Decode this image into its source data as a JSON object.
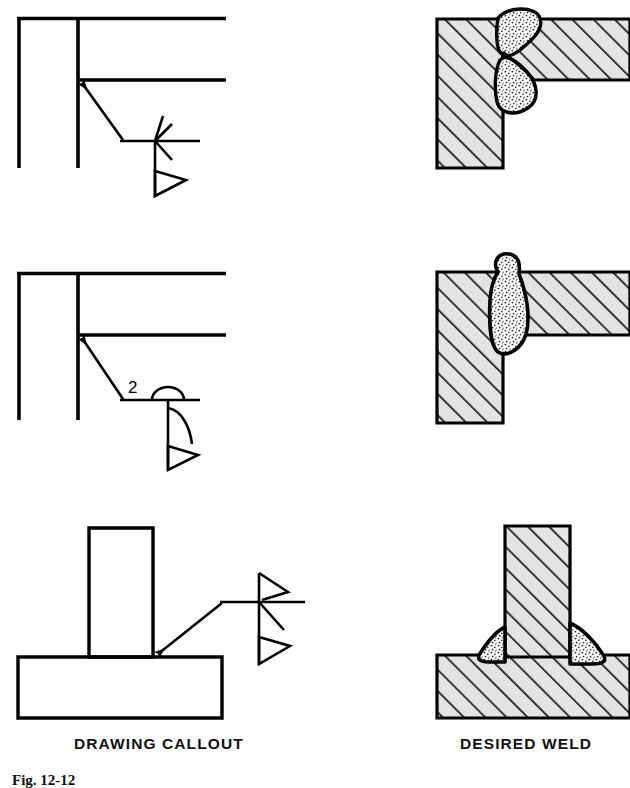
{
  "figure": {
    "captions": {
      "drawing_callout": "DRAWING CALLOUT",
      "desired_weld": "DESIRED WELD"
    },
    "figure_number": "Fig. 12-12",
    "colors": {
      "line": "#000000",
      "metal_fill": "#e3e3e3",
      "hatch": "#1a1a1a",
      "weld_fill": "#ffffff",
      "background": "#ffffff"
    }
  },
  "rows": [
    {
      "id": "row-1",
      "callout": {
        "joint_type": "corner-joint-flare-bevel",
        "weld_symbol": "double-flare-bevel-groove",
        "arrow_side_symbol": "flare-bevel",
        "other_side_symbol": "flare-bevel",
        "field_weld_flag": true,
        "size": "",
        "contour": ""
      },
      "weld": {
        "section_type": "corner-joint",
        "weld_passes": 2,
        "description": "double flare bevel groove weld both sides of corner"
      }
    },
    {
      "id": "row-2",
      "callout": {
        "joint_type": "corner-joint-flare-bevel",
        "weld_symbol": "single-flare-bevel-groove",
        "arrow_side_symbol": "flare-bevel",
        "other_side_symbol": "",
        "field_weld_flag": true,
        "size": "2",
        "contour": "convex"
      },
      "weld": {
        "section_type": "corner-joint",
        "weld_passes": 1,
        "description": "single flare bevel groove weld with convex contour"
      }
    },
    {
      "id": "row-3",
      "callout": {
        "joint_type": "tee-joint",
        "weld_symbol": "double-flare-bevel-groove",
        "arrow_side_symbol": "flare-bevel",
        "other_side_symbol": "flare-bevel",
        "field_weld_flag": true,
        "size": "",
        "contour": ""
      },
      "weld": {
        "section_type": "tee-joint",
        "weld_passes": 2,
        "description": "flare bevel groove welds both sides of vertical member"
      }
    }
  ]
}
